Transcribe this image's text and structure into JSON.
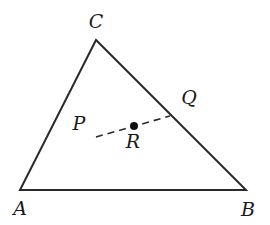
{
  "diagram": {
    "type": "geometry-triangle",
    "colors": {
      "stroke": "#2a2a2a",
      "label": "#1a1a1a",
      "background": "#ffffff"
    },
    "vertices": [
      {
        "id": "A",
        "label": "A",
        "x": 20,
        "y": 190
      },
      {
        "id": "B",
        "label": "B",
        "x": 246,
        "y": 190
      },
      {
        "id": "C",
        "label": "C",
        "x": 96,
        "y": 40
      }
    ],
    "points": [
      {
        "id": "P",
        "label": "P"
      },
      {
        "id": "Q",
        "label": "Q"
      },
      {
        "id": "R",
        "label": "R",
        "marker": "filled-dot"
      }
    ],
    "segments": [
      {
        "from": "A",
        "to": "B",
        "style": "solid"
      },
      {
        "from": "B",
        "to": "C",
        "style": "solid"
      },
      {
        "from": "C",
        "to": "A",
        "style": "solid"
      },
      {
        "from": "P",
        "to": "Q",
        "style": "dashed",
        "through": "R"
      }
    ]
  }
}
